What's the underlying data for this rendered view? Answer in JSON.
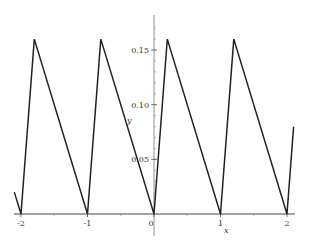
{
  "chart_data": {
    "type": "line",
    "title": "",
    "xlabel": "x",
    "ylabel": "y",
    "xlim": [
      -2.1,
      2.1
    ],
    "ylim": [
      -0.02,
      0.18
    ],
    "grid": false,
    "legend": null,
    "x_ticks": [
      -2,
      -1,
      0,
      1,
      2
    ],
    "x_tick_labels": [
      "-2",
      "-1",
      "0",
      "1",
      "2"
    ],
    "y_ticks": [
      0.05,
      0.1,
      0.15
    ],
    "y_tick_labels": [
      "0.05",
      "0.10",
      "0.15"
    ],
    "series": [
      {
        "name": "y",
        "color": "#222222",
        "x": [
          -2.1,
          -2.0,
          -1.8,
          -1.0,
          -0.8,
          0.0,
          0.2,
          1.0,
          1.2,
          2.0,
          2.1
        ],
        "y": [
          0.02,
          0.0,
          0.16,
          0.0,
          0.16,
          0.0,
          0.16,
          0.0,
          0.16,
          0.0,
          0.08
        ]
      }
    ]
  }
}
